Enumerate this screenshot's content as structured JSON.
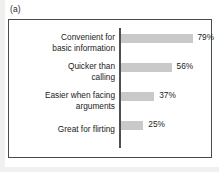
{
  "panel": {
    "tag": "(a)"
  },
  "colors": {
    "bar_fill": "#c9c9c9",
    "frame_border": "#4a4a4a",
    "axis_line": "#4f4f4f",
    "text": "#222222",
    "panel_background": "#ffffff"
  },
  "chart_data": {
    "type": "bar",
    "orientation": "horizontal",
    "title": "",
    "subtitle": "",
    "xlabel": "",
    "ylabel": "",
    "grid": false,
    "legend": "none",
    "xlim": [
      0,
      100
    ],
    "categories": [
      "Convenient for basic information",
      "Quicker than calling",
      "Easier when facing arguments",
      "Great for flirting"
    ],
    "category_lines": [
      [
        "Convenient for",
        "basic information"
      ],
      [
        "Quicker than",
        "calling"
      ],
      [
        "Easier when facing",
        "arguments"
      ],
      [
        "Great for flirting"
      ]
    ],
    "values": [
      79,
      56,
      37,
      25
    ],
    "value_labels": [
      "79%",
      "56%",
      "37%",
      "25%"
    ],
    "value_unit": "%"
  }
}
